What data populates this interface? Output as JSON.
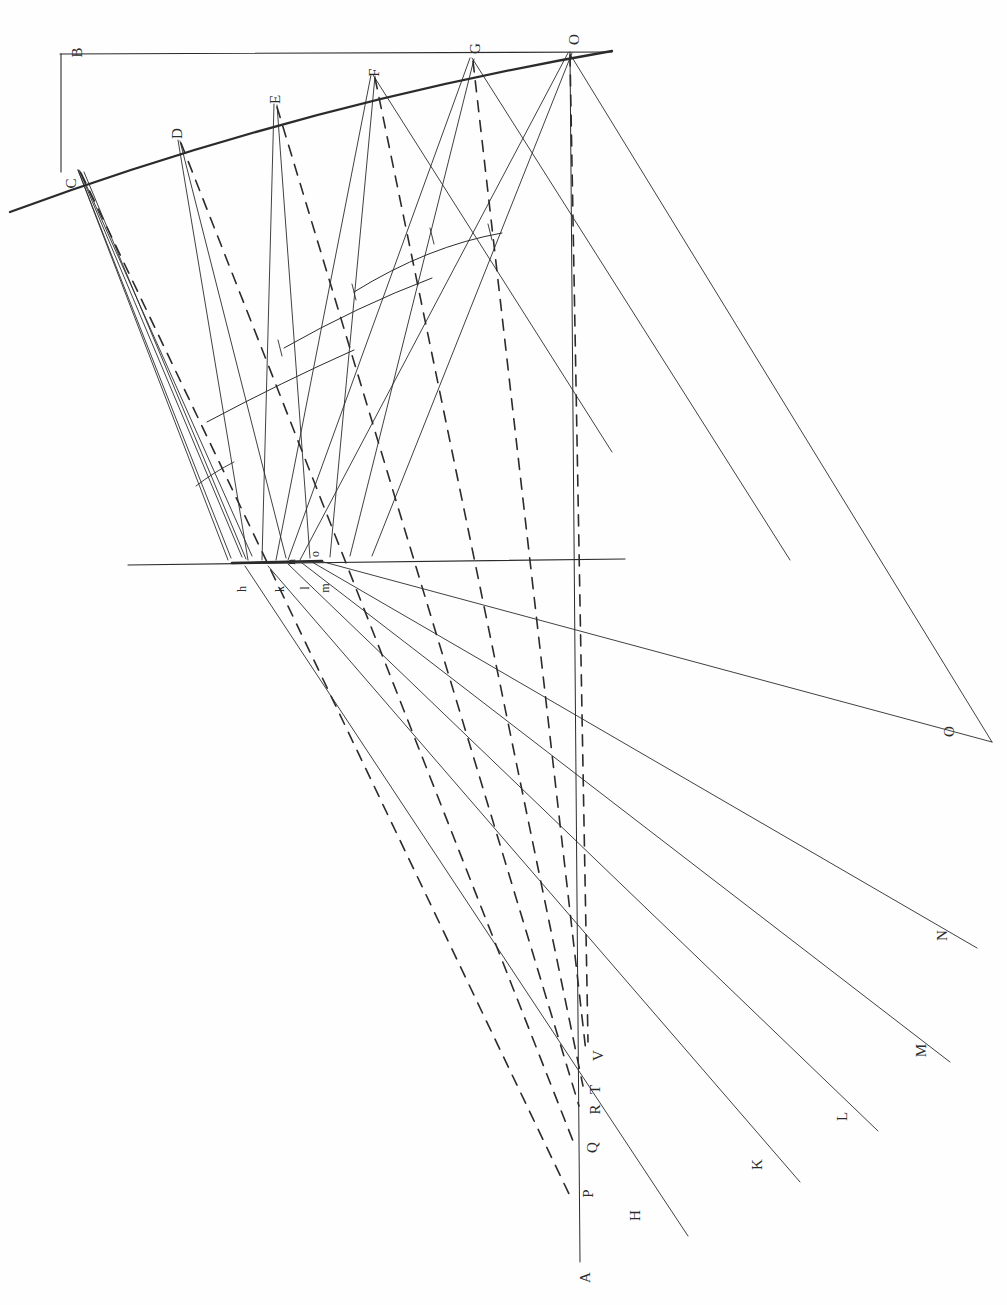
{
  "figure": {
    "type": "technical-line-drawing",
    "background_color": "#fefefe",
    "ink_color": "#2b2b2b",
    "orientation_note": "labels rotated 90 degrees counter-clockwise"
  },
  "labels": {
    "surface_points": [
      {
        "id": "B",
        "text": "B",
        "x": 72,
        "y": 45,
        "size": "normal"
      },
      {
        "id": "C",
        "text": "C",
        "x": 66,
        "y": 176,
        "size": "normal"
      },
      {
        "id": "D",
        "text": "D",
        "x": 172,
        "y": 126,
        "size": "normal"
      },
      {
        "id": "E",
        "text": "E",
        "x": 271,
        "y": 92,
        "size": "normal"
      },
      {
        "id": "F",
        "text": "F",
        "x": 370,
        "y": 65,
        "size": "normal"
      },
      {
        "id": "G",
        "text": "G",
        "x": 470,
        "y": 41,
        "size": "normal"
      },
      {
        "id": "O_top",
        "text": "O",
        "x": 569,
        "y": 32,
        "size": "normal"
      }
    ],
    "focal_points": [
      {
        "id": "h",
        "text": "h",
        "x": 239,
        "y": 583,
        "size": "small"
      },
      {
        "id": "k",
        "text": "k",
        "x": 277,
        "y": 583,
        "size": "small"
      },
      {
        "id": "l",
        "text": "l",
        "x": 303,
        "y": 582,
        "size": "small"
      },
      {
        "id": "m",
        "text": "m",
        "x": 320,
        "y": 582,
        "size": "small"
      },
      {
        "id": "n",
        "text": "n",
        "x": 288,
        "y": 556,
        "size": "small"
      },
      {
        "id": "o",
        "text": "o",
        "x": 312,
        "y": 548,
        "size": "small"
      }
    ],
    "axis_points": [
      {
        "id": "A",
        "text": "A",
        "x": 580,
        "y": 1270,
        "size": "normal"
      },
      {
        "id": "P",
        "text": "P",
        "x": 584,
        "y": 1186,
        "size": "normal"
      },
      {
        "id": "Q",
        "text": "Q",
        "x": 587,
        "y": 1140,
        "size": "normal"
      },
      {
        "id": "R",
        "text": "R",
        "x": 590,
        "y": 1102,
        "size": "normal"
      },
      {
        "id": "T",
        "text": "T",
        "x": 591,
        "y": 1082,
        "size": "normal"
      },
      {
        "id": "V",
        "text": "V",
        "x": 593,
        "y": 1048,
        "size": "normal"
      }
    ],
    "ray_endpoints": [
      {
        "id": "H",
        "text": "H",
        "x": 630,
        "y": 1208,
        "size": "normal"
      },
      {
        "id": "K",
        "text": "K",
        "x": 752,
        "y": 1157,
        "size": "normal"
      },
      {
        "id": "L",
        "text": "L",
        "x": 838,
        "y": 1109,
        "size": "normal"
      },
      {
        "id": "M",
        "text": "M",
        "x": 915,
        "y": 1043,
        "size": "normal"
      },
      {
        "id": "N",
        "text": "N",
        "x": 937,
        "y": 928,
        "size": "normal"
      },
      {
        "id": "O_end",
        "text": "O",
        "x": 944,
        "y": 724,
        "size": "normal"
      }
    ]
  },
  "geometry": {
    "datum_line": {
      "name": "B-to-O straight line",
      "x1": 60,
      "y1": 54,
      "x2": 608,
      "y2": 52
    },
    "vertical_drop": {
      "name": "B-to-C vertical",
      "x": 60,
      "y1": 54,
      "y2": 170
    },
    "mirror_arc": {
      "name": "curved reflecting surface through C D E F G O",
      "start": [
        10,
        212
      ],
      "end": [
        612,
        51
      ],
      "control": [
        300,
        105
      ]
    },
    "optical_axis": {
      "name": "horizontal axis through focal cluster",
      "x1": 128,
      "y1": 564,
      "x2": 625,
      "y2": 560
    },
    "principal_axis": {
      "name": "vertical line O to A",
      "x1": 570,
      "y1": 52,
      "x2": 580,
      "y2": 1262
    },
    "wavefront_arcs": [
      {
        "name": "arc-1",
        "start": [
          207,
          420
        ],
        "end": [
          352,
          348
        ],
        "sag": 18
      },
      {
        "name": "arc-2",
        "start": [
          283,
          346
        ],
        "end": [
          430,
          277
        ],
        "sag": 20
      },
      {
        "name": "arc-3",
        "start": [
          352,
          292
        ],
        "end": [
          500,
          232
        ],
        "sag": 22
      },
      {
        "name": "arc-small-wedge",
        "start": [
          196,
          484
        ],
        "end": [
          232,
          460
        ],
        "sag": 4
      }
    ],
    "ray_bundles": [
      {
        "from": "C",
        "apex": [
          78,
          170
        ],
        "focus": [
          245,
          566
        ],
        "spread": 9
      },
      {
        "from": "D",
        "apex": [
          178,
          140
        ],
        "focus": [
          268,
          566
        ],
        "spread": 12
      },
      {
        "from": "E",
        "apex": [
          275,
          104
        ],
        "focus": [
          288,
          564
        ],
        "spread": 16
      },
      {
        "from": "F",
        "apex": [
          373,
          75
        ],
        "focus": [
          302,
          563
        ],
        "spread": 20
      },
      {
        "from": "G",
        "apex": [
          472,
          58
        ],
        "focus": [
          312,
          562
        ],
        "spread": 24
      },
      {
        "from": "O",
        "apex": [
          570,
          52
        ],
        "focus": [
          320,
          561
        ],
        "spread": 28
      }
    ],
    "transmitted_rays": [
      {
        "name": "ray-to-H",
        "x1": 245,
        "y1": 566,
        "x2": 688,
        "y2": 1236
      },
      {
        "name": "ray-to-K",
        "x1": 268,
        "y1": 566,
        "x2": 800,
        "y2": 1182
      },
      {
        "name": "ray-to-L",
        "x1": 288,
        "y1": 564,
        "x2": 878,
        "y2": 1131
      },
      {
        "name": "ray-to-M",
        "x1": 302,
        "y1": 563,
        "x2": 950,
        "y2": 1062
      },
      {
        "name": "ray-to-N",
        "x1": 312,
        "y1": 562,
        "x2": 977,
        "y2": 948
      },
      {
        "name": "ray-to-O",
        "x1": 320,
        "y1": 561,
        "x2": 992,
        "y2": 742
      }
    ],
    "dashed_rays": [
      {
        "name": "dashed-C",
        "x1": 80,
        "y1": 172,
        "x2": 570,
        "y2": 1190
      },
      {
        "name": "dashed-D",
        "x1": 180,
        "y1": 142,
        "x2": 576,
        "y2": 1142
      },
      {
        "name": "dashed-E",
        "x1": 277,
        "y1": 106,
        "x2": 580,
        "y2": 1104
      },
      {
        "name": "dashed-F",
        "x1": 375,
        "y1": 77,
        "x2": 583,
        "y2": 1084
      },
      {
        "name": "dashed-G",
        "x1": 473,
        "y1": 60,
        "x2": 586,
        "y2": 1050
      },
      {
        "name": "dashed-O",
        "x1": 570,
        "y1": 54,
        "x2": 588,
        "y2": 1040
      }
    ],
    "wedge_outline": {
      "name": "narrow beam wedge from C to h",
      "points": "78,170 232,556 250,556 84,172"
    }
  }
}
